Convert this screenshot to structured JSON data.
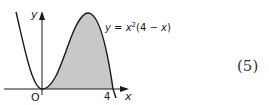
{
  "figure": {
    "curve_equation": "y = x²(4 − x)",
    "equation_parts": {
      "lhs": "y",
      "eq": " = ",
      "x": "x",
      "exp": "2",
      "rest_open": "(4 − ",
      "x2": "x",
      "rest_close": ")"
    },
    "x_axis_label": "x",
    "y_axis_label": "y",
    "origin_label": "O",
    "root_label": "4",
    "shaded_region": "area between curve and x-axis from x=0 to x=4",
    "colors": {
      "curve": "#1a1a1a",
      "shade": "#c8c8c8",
      "axis": "#1a1a1a"
    }
  },
  "marks": "(5)"
}
